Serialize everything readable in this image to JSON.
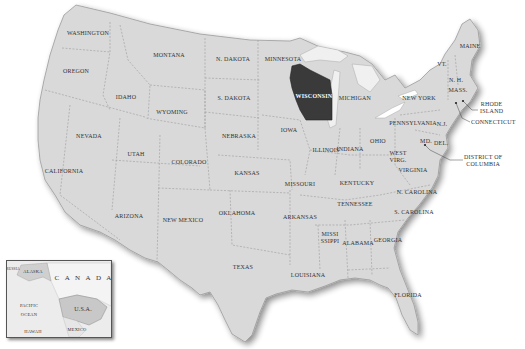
{
  "map": {
    "title": "United States",
    "highlighted_state": "WISCONSIN",
    "colors": {
      "land": "#d9d9d9",
      "highlight": "#3a3a3a",
      "water": "#ffffff",
      "border": "#8a8a8a",
      "lakes": "#f0f0f0"
    },
    "states": [
      {
        "name": "WASHINGTON",
        "x": 65,
        "y": 33
      },
      {
        "name": "OREGON",
        "x": 76,
        "y": 71
      },
      {
        "name": "IDAHO",
        "x": 126,
        "y": 97
      },
      {
        "name": "MONTANA",
        "x": 169,
        "y": 55
      },
      {
        "name": "WYOMING",
        "x": 172,
        "y": 112
      },
      {
        "name": "N. DAKOTA",
        "x": 233,
        "y": 59
      },
      {
        "name": "S. DAKOTA",
        "x": 234,
        "y": 98
      },
      {
        "name": "MINNESOTA",
        "x": 283,
        "y": 59
      },
      {
        "name": "NEVADA",
        "x": 89,
        "y": 136
      },
      {
        "name": "UTAH",
        "x": 136,
        "y": 154
      },
      {
        "name": "COLORADO",
        "x": 189,
        "y": 162
      },
      {
        "name": "NEBRASKA",
        "x": 239,
        "y": 136
      },
      {
        "name": "IOWA",
        "x": 289,
        "y": 130
      },
      {
        "name": "CALIFORNIA",
        "x": 68,
        "y": 171
      },
      {
        "name": "KANSAS",
        "x": 247,
        "y": 173
      },
      {
        "name": "MISSOURI",
        "x": 300,
        "y": 184
      },
      {
        "name": "ILLINOIS",
        "x": 326,
        "y": 150
      },
      {
        "name": "INDIANA",
        "x": 350,
        "y": 149
      },
      {
        "name": "OHIO",
        "x": 378,
        "y": 141
      },
      {
        "name": "MICHIGAN",
        "x": 355,
        "y": 98
      },
      {
        "name": "WISCONSIN",
        "x": 314,
        "y": 96
      },
      {
        "name": "KENTUCKY",
        "x": 357,
        "y": 183
      },
      {
        "name": "WEST VIRG.",
        "x": 398,
        "y": 157
      },
      {
        "name": "VIRGINIA",
        "x": 413,
        "y": 170
      },
      {
        "name": "TENNESSEE",
        "x": 355,
        "y": 204
      },
      {
        "name": "N. CAROLINA",
        "x": 417,
        "y": 192
      },
      {
        "name": "S. CAROLINA",
        "x": 414,
        "y": 212
      },
      {
        "name": "ARKANSAS",
        "x": 300,
        "y": 217
      },
      {
        "name": "OKLAHOMA",
        "x": 237,
        "y": 213
      },
      {
        "name": "ARIZONA",
        "x": 129,
        "y": 216
      },
      {
        "name": "NEW MEXICO",
        "x": 183,
        "y": 220
      },
      {
        "name": "TEXAS",
        "x": 243,
        "y": 267
      },
      {
        "name": "MISSISSIPPI",
        "x": 330,
        "y": 238
      },
      {
        "name": "ALABAMA",
        "x": 358,
        "y": 243
      },
      {
        "name": "GEORGIA",
        "x": 388,
        "y": 240
      },
      {
        "name": "LOUISIANA",
        "x": 308,
        "y": 275
      },
      {
        "name": "FLORIDA",
        "x": 408,
        "y": 295
      },
      {
        "name": "NEW YORK",
        "x": 419,
        "y": 98
      },
      {
        "name": "PENNSYLVANIA",
        "x": 413,
        "y": 123
      },
      {
        "name": "N.J.",
        "x": 442,
        "y": 124
      },
      {
        "name": "MD.",
        "x": 426,
        "y": 141
      },
      {
        "name": "DEL.",
        "x": 441,
        "y": 143
      },
      {
        "name": "VT.",
        "x": 442,
        "y": 64
      },
      {
        "name": "N. H.",
        "x": 456,
        "y": 80
      },
      {
        "name": "MASS.",
        "x": 458,
        "y": 90
      },
      {
        "name": "MAINE",
        "x": 470,
        "y": 46
      }
    ],
    "callouts": [
      {
        "name": "RHODE ISLAND",
        "line1": "RHODE",
        "line2": "ISLAND",
        "x": 482,
        "y": 108
      },
      {
        "name": "CONNECTICUT",
        "line1": "CONNECTICUT",
        "line2": "",
        "x": 472,
        "y": 122
      },
      {
        "name": "DISTRICT OF COLUMBIA",
        "line1": "DISTRICT OF",
        "line2": "COLUMBIA",
        "x": 466,
        "y": 159
      }
    ],
    "inset": {
      "labels": {
        "alaska": "ALASKA",
        "canada": "C A N A D A",
        "pacific1": "PACIFIC",
        "pacific2": "OCEAN",
        "usa": "U.S.A.",
        "hawaii": "HAWAII",
        "mexico": "MEXICO",
        "russia": "RUSSIA"
      }
    }
  }
}
